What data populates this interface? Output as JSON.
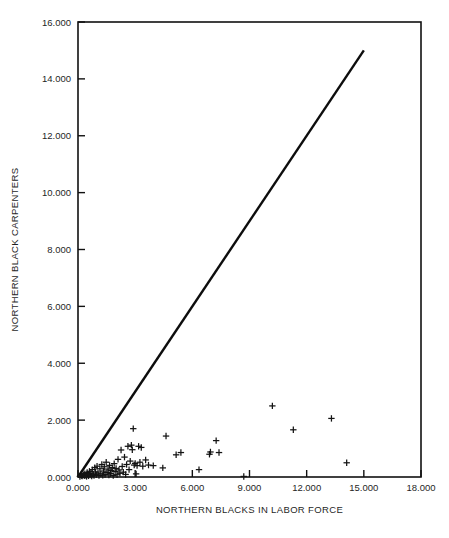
{
  "chart_data": {
    "type": "scatter",
    "title": "",
    "subtitle": "",
    "xlabel": "NORTHERN BLACKS IN LABOR FORCE",
    "ylabel": "NORTHERN BLACK CARPENTERS",
    "xlim": [
      0,
      18
    ],
    "ylim": [
      0,
      16
    ],
    "xticks": [
      0,
      3,
      6,
      9,
      12,
      15,
      18
    ],
    "yticks": [
      0,
      2,
      4,
      6,
      8,
      10,
      12,
      14,
      16
    ],
    "xtick_labels": [
      "0.000",
      "3.000",
      "6.000",
      "9.000",
      "12.000",
      "15.000",
      "18.000"
    ],
    "ytick_labels": [
      "0.000",
      "2.000",
      "4.000",
      "6.000",
      "8.000",
      "10.000",
      "12.000",
      "14.000",
      "16.000"
    ],
    "grid": false,
    "legend": null,
    "legend_position": "none",
    "marker_symbol": "plus",
    "marker_color": "#141414",
    "line_color": "#0d0d0d",
    "frame_color": "#111111",
    "background_color": "#ffffff",
    "reference_line": {
      "label": "identity line y = x",
      "x": [
        0.0,
        15.0
      ],
      "y": [
        0.0,
        15.0
      ]
    },
    "points": [
      {
        "x": 0.1,
        "y": 0.02
      },
      {
        "x": 0.18,
        "y": 0.05
      },
      {
        "x": 0.22,
        "y": 0.03
      },
      {
        "x": 0.28,
        "y": 0.08
      },
      {
        "x": 0.33,
        "y": 0.04
      },
      {
        "x": 0.36,
        "y": 0.12
      },
      {
        "x": 0.4,
        "y": 0.06
      },
      {
        "x": 0.45,
        "y": 0.02
      },
      {
        "x": 0.48,
        "y": 0.16
      },
      {
        "x": 0.52,
        "y": 0.09
      },
      {
        "x": 0.55,
        "y": 0.04
      },
      {
        "x": 0.6,
        "y": 0.2
      },
      {
        "x": 0.63,
        "y": 0.07
      },
      {
        "x": 0.68,
        "y": 0.13
      },
      {
        "x": 0.72,
        "y": 0.03
      },
      {
        "x": 0.75,
        "y": 0.26
      },
      {
        "x": 0.8,
        "y": 0.1
      },
      {
        "x": 0.84,
        "y": 0.05
      },
      {
        "x": 0.88,
        "y": 0.33
      },
      {
        "x": 0.92,
        "y": 0.18
      },
      {
        "x": 0.96,
        "y": 0.08
      },
      {
        "x": 1.0,
        "y": 0.38
      },
      {
        "x": 1.05,
        "y": 0.14
      },
      {
        "x": 1.1,
        "y": 0.05
      },
      {
        "x": 1.15,
        "y": 0.29
      },
      {
        "x": 1.2,
        "y": 0.11
      },
      {
        "x": 1.25,
        "y": 0.44
      },
      {
        "x": 1.3,
        "y": 0.06
      },
      {
        "x": 1.34,
        "y": 0.21
      },
      {
        "x": 1.38,
        "y": 0.36
      },
      {
        "x": 1.42,
        "y": 0.09
      },
      {
        "x": 1.48,
        "y": 0.52
      },
      {
        "x": 1.52,
        "y": 0.16
      },
      {
        "x": 1.58,
        "y": 0.28
      },
      {
        "x": 1.62,
        "y": 0.07
      },
      {
        "x": 1.66,
        "y": 0.41
      },
      {
        "x": 1.7,
        "y": 0.12
      },
      {
        "x": 1.74,
        "y": 0.23
      },
      {
        "x": 1.8,
        "y": 0.33
      },
      {
        "x": 1.85,
        "y": 0.05
      },
      {
        "x": 1.9,
        "y": 0.47
      },
      {
        "x": 1.95,
        "y": 0.19
      },
      {
        "x": 2.0,
        "y": 0.3
      },
      {
        "x": 2.05,
        "y": 0.08
      },
      {
        "x": 2.1,
        "y": 0.62
      },
      {
        "x": 2.15,
        "y": 0.25
      },
      {
        "x": 2.2,
        "y": 0.13
      },
      {
        "x": 2.26,
        "y": 0.95
      },
      {
        "x": 2.32,
        "y": 0.37
      },
      {
        "x": 2.38,
        "y": 0.17
      },
      {
        "x": 2.44,
        "y": 0.7
      },
      {
        "x": 2.5,
        "y": 0.09
      },
      {
        "x": 2.55,
        "y": 0.44
      },
      {
        "x": 2.62,
        "y": 1.08
      },
      {
        "x": 2.68,
        "y": 0.26
      },
      {
        "x": 2.74,
        "y": 0.56
      },
      {
        "x": 2.8,
        "y": 1.12
      },
      {
        "x": 2.85,
        "y": 0.96
      },
      {
        "x": 2.9,
        "y": 1.7
      },
      {
        "x": 2.95,
        "y": 0.42
      },
      {
        "x": 3.0,
        "y": 0.48
      },
      {
        "x": 3.05,
        "y": 0.11
      },
      {
        "x": 3.1,
        "y": 0.4
      },
      {
        "x": 3.18,
        "y": 1.08
      },
      {
        "x": 3.25,
        "y": 0.52
      },
      {
        "x": 3.32,
        "y": 1.04
      },
      {
        "x": 3.4,
        "y": 0.38
      },
      {
        "x": 3.55,
        "y": 0.6
      },
      {
        "x": 3.7,
        "y": 0.42
      },
      {
        "x": 3.95,
        "y": 0.4
      },
      {
        "x": 4.45,
        "y": 0.32
      },
      {
        "x": 4.62,
        "y": 1.44
      },
      {
        "x": 5.15,
        "y": 0.78
      },
      {
        "x": 5.4,
        "y": 0.86
      },
      {
        "x": 6.35,
        "y": 0.26
      },
      {
        "x": 6.9,
        "y": 0.8
      },
      {
        "x": 6.95,
        "y": 0.88
      },
      {
        "x": 7.25,
        "y": 1.28
      },
      {
        "x": 7.4,
        "y": 0.86
      },
      {
        "x": 8.7,
        "y": 0.02
      },
      {
        "x": 10.2,
        "y": 2.5
      },
      {
        "x": 11.3,
        "y": 1.66
      },
      {
        "x": 13.3,
        "y": 2.06
      },
      {
        "x": 14.1,
        "y": 0.5
      }
    ]
  },
  "figure": {
    "plot_area": {
      "left": 78,
      "top": 22,
      "right": 421,
      "bottom": 477
    }
  }
}
